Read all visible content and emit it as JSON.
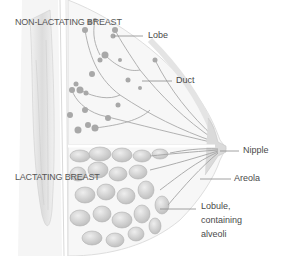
{
  "figure": {
    "sections": [
      {
        "id": "non-lactating",
        "label": "NON-LACTATING BREAST"
      },
      {
        "id": "lactating",
        "label": "LACTATING BREAST"
      }
    ],
    "labels": [
      {
        "id": "lobe",
        "text": "Lobe"
      },
      {
        "id": "duct",
        "text": "Duct"
      },
      {
        "id": "nipple",
        "text": "Nipple"
      },
      {
        "id": "areola",
        "text": "Areola"
      },
      {
        "id": "lobule",
        "lines": [
          "Lobule,",
          "containing",
          "alveoli"
        ]
      }
    ],
    "colors": {
      "background": "#ffffff",
      "illustration": "#b8b8b8",
      "label_text": "#4a4a4a",
      "leader_line": "#8a8a8a"
    }
  }
}
